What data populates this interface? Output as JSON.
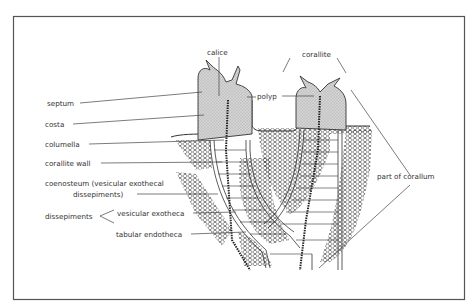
{
  "diagram": {
    "type": "labeled-illustration",
    "labels": {
      "calice": "calice",
      "corallite": "corallite",
      "polyp": "polyp",
      "septum": "septum",
      "costa": "costa",
      "columella": "columella",
      "corallite_wall": "corallite wall",
      "coenosteum_line1": "coenosteum (vesicular exothecal",
      "coenosteum_line2": "dissepiments)",
      "dissepiments": "dissepiments",
      "vesicular_exotheca": "vesicular exotheca",
      "tabular_endotheca": "tabular endotheca",
      "part_of_corallum": "part of corallum"
    },
    "colors": {
      "ink": "#333333",
      "frame": "#555555",
      "polyp_fill": "#c8c8c8",
      "background": "#ffffff"
    }
  }
}
